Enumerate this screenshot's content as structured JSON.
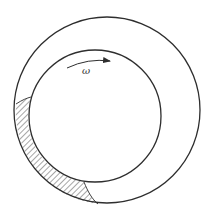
{
  "diagram": {
    "labels": {
      "angular_velocity": "ω"
    },
    "colors": {
      "stroke": "#2e2e2e",
      "background": "#ffffff",
      "hatch": "#3a3a3a"
    },
    "elements": [
      {
        "name": "outer-circle",
        "type": "circle",
        "cx": 107,
        "cy": 110,
        "r": 93
      },
      {
        "name": "inner-circle",
        "type": "circle",
        "cx": 95,
        "cy": 116,
        "r": 66
      },
      {
        "name": "rotation-arrow",
        "type": "arc-arrow",
        "direction": "clockwise"
      },
      {
        "name": "hatched-region",
        "type": "crescent",
        "location": "lower-left gap between circles"
      }
    ]
  }
}
